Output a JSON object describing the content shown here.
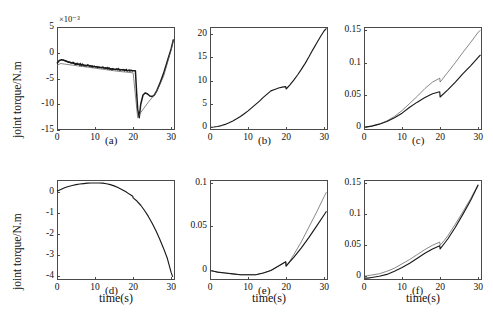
{
  "figure": {
    "axis_label_y": "joint torque/N.m",
    "axis_label_x": "time(s)",
    "exponent_label": "×10⁻³",
    "line_colors": {
      "measured": "#1a1a1a",
      "reference": "#555555"
    }
  },
  "chart_data": [
    {
      "type": "line",
      "panel": "(a)",
      "title": "",
      "xlabel": "time(s)",
      "ylabel": "joint torque/N.m",
      "y_scale_exponent": "×10⁻³",
      "xlim": [
        0,
        31
      ],
      "ylim": [
        -15,
        5
      ],
      "xticks": [
        "0",
        "10",
        "20",
        "30"
      ],
      "yticks": [
        "5",
        "0",
        "-5",
        "-10",
        "-15"
      ],
      "grid": false,
      "series": [
        {
          "name": "measured",
          "x": [
            0,
            0.6,
            1.2,
            2,
            3,
            4,
            5,
            6,
            7,
            8,
            9,
            10,
            11,
            12,
            13,
            14,
            15,
            16,
            17,
            18,
            19,
            20,
            20.6,
            20.9,
            21.2,
            21.6,
            22,
            22.6,
            23.2,
            23.8,
            24.4,
            25,
            25.6,
            26.2,
            27,
            28,
            29,
            30,
            30.6
          ],
          "y": [
            -2.1,
            -1.5,
            -1.35,
            -1.5,
            -1.8,
            -2.0,
            -2.15,
            -2.3,
            -2.4,
            -2.5,
            -2.6,
            -2.7,
            -2.8,
            -2.9,
            -3.0,
            -3.1,
            -3.2,
            -3.25,
            -3.3,
            -3.4,
            -3.45,
            -3.5,
            -3.5,
            -7.5,
            -11.0,
            -12.6,
            -10.0,
            -8.2,
            -7.8,
            -8.0,
            -8.4,
            -8.5,
            -8.2,
            -7.4,
            -6.0,
            -4.0,
            -1.6,
            0.8,
            2.6
          ]
        },
        {
          "name": "reference",
          "x": [
            0,
            1,
            2,
            4,
            6,
            8,
            10,
            12,
            14,
            16,
            18,
            20,
            21.2,
            22,
            24,
            26,
            28,
            30,
            30.6
          ],
          "y": [
            -2.4,
            -2.1,
            -2.2,
            -2.4,
            -2.6,
            -2.8,
            -3.0,
            -3.2,
            -3.4,
            -3.6,
            -3.75,
            -3.9,
            -12.6,
            -11.6,
            -9.6,
            -7.8,
            -4.6,
            0.6,
            2.6
          ]
        }
      ]
    },
    {
      "type": "line",
      "panel": "(b)",
      "title": "",
      "xlabel": "time(s)",
      "ylabel": "",
      "xlim": [
        0,
        31
      ],
      "ylim": [
        -0.6,
        21.5
      ],
      "xticks": [
        "0",
        "10",
        "20",
        "30"
      ],
      "yticks": [
        "20",
        "15",
        "10",
        "5",
        "0"
      ],
      "grid": false,
      "series": [
        {
          "name": "measured",
          "x": [
            0,
            1,
            2,
            3,
            4,
            5,
            6,
            7,
            8,
            9,
            10,
            11,
            12,
            13,
            14,
            15,
            16,
            17,
            18,
            19,
            19.9,
            20.0,
            21,
            22,
            23,
            24,
            25,
            26,
            27,
            28,
            29,
            30,
            30.6
          ],
          "y": [
            0.0,
            0.05,
            0.15,
            0.35,
            0.6,
            0.95,
            1.35,
            1.8,
            2.3,
            2.9,
            3.5,
            4.2,
            4.9,
            5.6,
            6.4,
            7.1,
            7.8,
            8.1,
            8.4,
            8.6,
            8.7,
            8.2,
            9.1,
            10.1,
            11.2,
            12.4,
            13.7,
            15.1,
            16.6,
            18.0,
            19.4,
            20.7,
            21.2
          ]
        }
      ]
    },
    {
      "type": "line",
      "panel": "(c)",
      "title": "",
      "xlabel": "time(s)",
      "ylabel": "",
      "xlim": [
        0,
        31
      ],
      "ylim": [
        -0.004,
        0.155
      ],
      "xticks": [
        "0",
        "10",
        "20",
        "30"
      ],
      "yticks": [
        "0.15",
        "0.1",
        "0.05",
        "0"
      ],
      "grid": false,
      "series": [
        {
          "name": "reference",
          "x": [
            0,
            2,
            4,
            6,
            8,
            10,
            12,
            14,
            16,
            18,
            19.9,
            20.0,
            22,
            24,
            26,
            28,
            30,
            30.6
          ],
          "y": [
            0.0,
            0.002,
            0.005,
            0.01,
            0.017,
            0.026,
            0.037,
            0.048,
            0.06,
            0.07,
            0.076,
            0.07,
            0.085,
            0.1,
            0.116,
            0.131,
            0.147,
            0.15
          ]
        },
        {
          "name": "measured",
          "x": [
            0,
            2,
            4,
            6,
            8,
            10,
            12,
            14,
            16,
            18,
            19.9,
            20.0,
            22,
            24,
            26,
            28,
            30,
            30.6
          ],
          "y": [
            0.0,
            0.002,
            0.005,
            0.009,
            0.015,
            0.022,
            0.031,
            0.039,
            0.046,
            0.052,
            0.055,
            0.047,
            0.058,
            0.07,
            0.083,
            0.095,
            0.108,
            0.112
          ]
        }
      ]
    },
    {
      "type": "line",
      "panel": "(d)",
      "title": "",
      "xlabel": "time(s)",
      "ylabel": "joint torque/N.m",
      "xlim": [
        0,
        31
      ],
      "ylim": [
        -4.2,
        0.55
      ],
      "xticks": [
        "0",
        "10",
        "20",
        "30"
      ],
      "yticks": [
        "0",
        "-1",
        "-2",
        "-3",
        "-4"
      ],
      "grid": false,
      "series": [
        {
          "name": "measured",
          "x": [
            0,
            1,
            2,
            3,
            4,
            5,
            6,
            7,
            8,
            9,
            10,
            11,
            12,
            13,
            14,
            15,
            16,
            17,
            18,
            19,
            19.9,
            20.0,
            21,
            22,
            23,
            24,
            25,
            26,
            27,
            28,
            29,
            30,
            30.4
          ],
          "y": [
            0.02,
            0.1,
            0.18,
            0.24,
            0.29,
            0.33,
            0.36,
            0.38,
            0.4,
            0.41,
            0.41,
            0.41,
            0.4,
            0.37,
            0.33,
            0.27,
            0.19,
            0.1,
            0.0,
            -0.12,
            -0.22,
            -0.3,
            -0.45,
            -0.65,
            -0.9,
            -1.18,
            -1.5,
            -1.86,
            -2.26,
            -2.7,
            -3.18,
            -3.85,
            -4.05
          ]
        }
      ]
    },
    {
      "type": "line",
      "panel": "(e)",
      "title": "",
      "xlabel": "time(s)",
      "ylabel": "",
      "xlim": [
        0,
        31
      ],
      "ylim": [
        -0.012,
        0.103
      ],
      "xticks": [
        "0",
        "10",
        "20",
        "30"
      ],
      "yticks": [
        "0.1",
        "0.05",
        "0"
      ],
      "grid": false,
      "series": [
        {
          "name": "reference",
          "x": [
            0,
            1,
            2,
            4,
            6,
            8,
            10,
            12,
            14,
            16,
            18,
            19.9,
            20.0,
            21,
            22,
            24,
            26,
            28,
            30,
            30.6
          ],
          "y": [
            -0.001,
            -0.002,
            -0.003,
            -0.004,
            -0.005,
            -0.006,
            -0.006,
            -0.006,
            -0.004,
            -0.001,
            0.004,
            0.009,
            0.004,
            0.01,
            0.017,
            0.032,
            0.049,
            0.066,
            0.084,
            0.089
          ]
        },
        {
          "name": "measured",
          "x": [
            0,
            1,
            2,
            4,
            6,
            8,
            10,
            12,
            14,
            16,
            18,
            19.9,
            20.0,
            21,
            22,
            24,
            26,
            28,
            30,
            30.6
          ],
          "y": [
            -0.001,
            -0.002,
            -0.003,
            -0.004,
            -0.005,
            -0.006,
            -0.006,
            -0.006,
            -0.004,
            -0.001,
            0.004,
            0.009,
            0.004,
            0.009,
            0.014,
            0.025,
            0.037,
            0.05,
            0.063,
            0.067
          ]
        }
      ]
    },
    {
      "type": "line",
      "panel": "(f)",
      "title": "",
      "xlabel": "time(s)",
      "ylabel": "",
      "xlim": [
        0,
        31
      ],
      "ylim": [
        -0.006,
        0.155
      ],
      "xticks": [
        "0",
        "10",
        "20",
        "30"
      ],
      "yticks": [
        "0.15",
        "0.1",
        "0.05",
        "0"
      ],
      "grid": false,
      "series": [
        {
          "name": "reference",
          "x": [
            0,
            1,
            2,
            4,
            6,
            8,
            10,
            12,
            14,
            16,
            18,
            19.9,
            20.0,
            21,
            22,
            24,
            26,
            28,
            30
          ],
          "y": [
            0.0,
            0.001,
            0.002,
            0.004,
            0.008,
            0.013,
            0.02,
            0.027,
            0.035,
            0.043,
            0.05,
            0.055,
            0.05,
            0.057,
            0.065,
            0.084,
            0.104,
            0.125,
            0.148
          ]
        },
        {
          "name": "measured",
          "x": [
            0,
            1,
            2,
            4,
            6,
            8,
            10,
            12,
            14,
            16,
            18,
            19.9,
            20.0,
            21,
            22,
            24,
            26,
            28,
            30
          ],
          "y": [
            -0.003,
            -0.003,
            -0.002,
            0.0,
            0.003,
            0.008,
            0.014,
            0.021,
            0.029,
            0.037,
            0.044,
            0.049,
            0.044,
            0.052,
            0.06,
            0.079,
            0.1,
            0.122,
            0.147
          ]
        }
      ]
    }
  ]
}
